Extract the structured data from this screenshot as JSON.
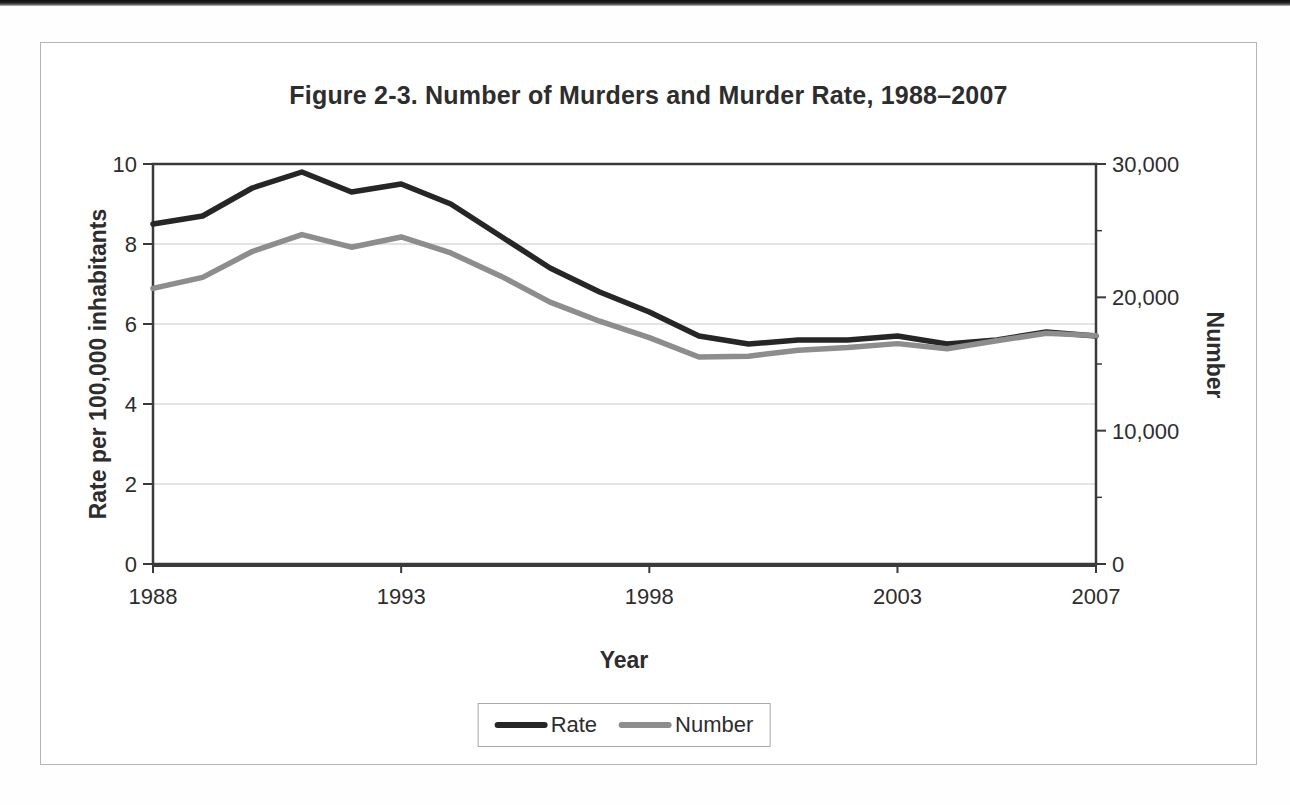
{
  "chart_data": {
    "type": "line",
    "title": "Figure 2-3. Number of Murders and Murder Rate, 1988–2007",
    "xlabel": "Year",
    "ylabel_left": "Rate per 100,000 inhabitants",
    "ylabel_right": "Number",
    "x": [
      1988,
      1989,
      1990,
      1991,
      1992,
      1993,
      1994,
      1995,
      1996,
      1997,
      1998,
      1999,
      2000,
      2001,
      2002,
      2003,
      2004,
      2005,
      2006,
      2007
    ],
    "x_tick_labels": [
      "1988",
      "1993",
      "1998",
      "2003",
      "2007"
    ],
    "ylim_left": [
      0,
      10
    ],
    "yticks_left": [
      0,
      2,
      4,
      6,
      8,
      10
    ],
    "ylim_right": [
      0,
      30000
    ],
    "yticks_right": [
      0,
      10000,
      20000,
      30000
    ],
    "yticks_right_labels": [
      "0",
      "10,000",
      "20,000",
      "30,000"
    ],
    "yticks_right_minor": [
      5000,
      15000,
      25000
    ],
    "grid": "horizontal-light",
    "legend_position": "bottom-center",
    "series": [
      {
        "name": "Rate",
        "axis": "left",
        "color": "#262626",
        "values": [
          8.5,
          8.7,
          9.4,
          9.8,
          9.3,
          9.5,
          9.0,
          8.2,
          7.4,
          6.8,
          6.3,
          5.7,
          5.5,
          5.6,
          5.6,
          5.7,
          5.5,
          5.6,
          5.8,
          5.7
        ]
      },
      {
        "name": "Number",
        "axis": "right",
        "color": "#8d8d8d",
        "values": [
          20675,
          21500,
          23438,
          24703,
          23760,
          24526,
          23326,
          21606,
          19645,
          18208,
          16974,
          15522,
          15586,
          16037,
          16229,
          16528,
          16148,
          16740,
          17309,
          17128
        ]
      }
    ]
  },
  "colors": {
    "rate_line": "#262626",
    "number_line": "#8d8d8d",
    "grid": "#dadada",
    "axis": "#3a3a3a",
    "text": "#2d2d2d",
    "figure_border": "#b5b5b5"
  }
}
